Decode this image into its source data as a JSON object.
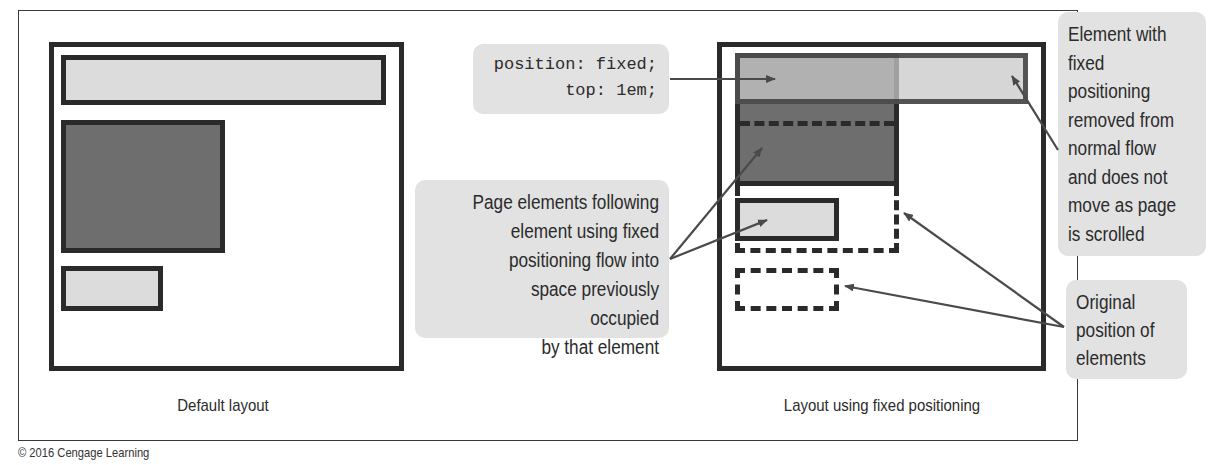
{
  "figure": {
    "copyright": "© 2016 Cengage Learning"
  },
  "left_panel": {
    "caption": "Default layout",
    "elements": [
      {
        "name": "header",
        "fill": "light"
      },
      {
        "name": "content",
        "fill": "dark"
      },
      {
        "name": "footer-box",
        "fill": "light"
      }
    ]
  },
  "right_panel": {
    "caption": "Layout using fixed positioning",
    "code_callout": {
      "lines": [
        "position: fixed;",
        "top: 1em;"
      ]
    }
  },
  "callouts": {
    "flow": {
      "lines": [
        "Page elements following",
        "element using fixed",
        "positioning flow into",
        "space previously occupied",
        "by that element"
      ]
    },
    "fixed": {
      "lines": [
        "Element with",
        "fixed",
        "positioning",
        "removed from",
        "normal flow",
        "and does not",
        "move as page",
        "is scrolled"
      ]
    },
    "original": {
      "lines": [
        "Original",
        "position of",
        "elements"
      ]
    }
  },
  "colors": {
    "light_fill": "#dcdcdc",
    "dark_fill": "#6e6e6e",
    "outline": "#2a2a2a",
    "callout_bg": "#e2e2e2",
    "arrow": "#4a4a4a"
  }
}
